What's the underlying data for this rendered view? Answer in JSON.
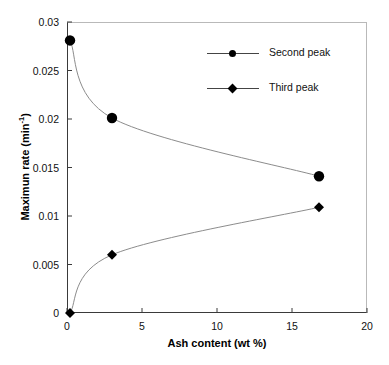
{
  "chart_data": {
    "type": "line",
    "title": "",
    "subtitle": "",
    "xlabel": "Ash content (wt %)",
    "ylabel": "Maximun rate (min",
    "ylabel_exponent": "-1",
    "ylabel_suffix": ")",
    "xlim": [
      0,
      20
    ],
    "ylim": [
      0,
      0.03
    ],
    "xticks": [
      0,
      5,
      10,
      15,
      20
    ],
    "xtick_labels": [
      "0",
      "5",
      "10",
      "15",
      "20"
    ],
    "yticks": [
      0,
      0.005,
      0.01,
      0.015,
      0.02,
      0.025,
      0.03
    ],
    "ytick_labels": [
      "0",
      "0.005",
      "0.01",
      "0.015",
      "0.02",
      "0.025",
      "0.03"
    ],
    "grid": false,
    "legend_position": "upper right",
    "series": [
      {
        "name": "Second peak",
        "marker": "circle",
        "color": "#000000",
        "line_color": "#8c8c8c",
        "points": [
          {
            "x": 0.2,
            "y": 0.0281
          },
          {
            "x": 3.0,
            "y": 0.0201
          },
          {
            "x": 16.8,
            "y": 0.0141
          }
        ]
      },
      {
        "name": "Third peak",
        "marker": "diamond",
        "color": "#000000",
        "line_color": "#8c8c8c",
        "points": [
          {
            "x": 0.2,
            "y": 0.0
          },
          {
            "x": 3.0,
            "y": 0.006
          },
          {
            "x": 16.8,
            "y": 0.0109
          }
        ]
      }
    ]
  },
  "legend": {
    "items": [
      {
        "label": "Second peak",
        "marker": "circle"
      },
      {
        "label": "Third peak",
        "marker": "diamond"
      }
    ]
  }
}
